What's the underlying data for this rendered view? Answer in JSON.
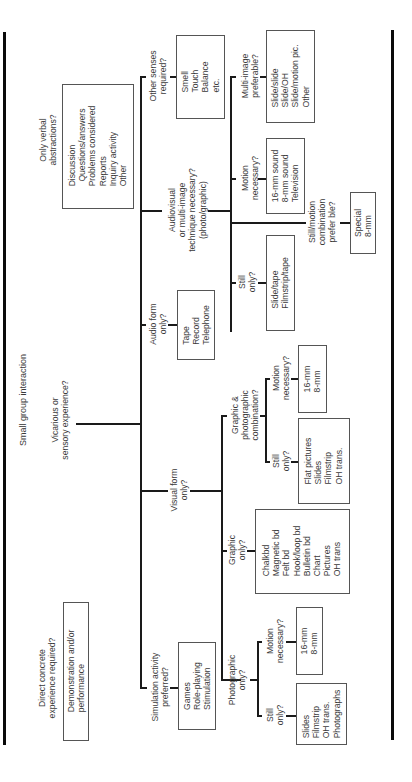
{
  "title": "Small group interaction",
  "root": {
    "vicarious": "Vicarious or|sensory experience?",
    "direct": "Direct concrete|experience required?",
    "direct_box": [
      "Demonstration and/or",
      "performance"
    ]
  },
  "verbal": {
    "question": "Only verbal|abstractions?",
    "box": [
      "Discussion",
      "  Questions/answers",
      "Problems considered",
      "Reports",
      "Inquiry activity",
      "Other"
    ]
  },
  "senses": {
    "question": "Other senses|required?",
    "box": [
      "Smell",
      "Touch",
      "Balance",
      "etc."
    ]
  },
  "audiovisual": {
    "question": "Audiovisual|or multi-image|technique necessary?|(photo/graphic)",
    "multi": {
      "question": "Multi-image|preferable?",
      "box": [
        "Slide/slide",
        "Slide/OH",
        "Slide/motion pic.",
        "Other"
      ]
    },
    "motion": {
      "question": "Motion|necessary?",
      "box": [
        "16-mm sound",
        "8-mm sound",
        "Television"
      ]
    },
    "combo": {
      "question": "Still/motion|combination|prefer ble?",
      "box": [
        "Special",
        "8-mm"
      ]
    },
    "still": {
      "question": "Still|only?",
      "box": [
        "Slide/tape",
        "Filmstrip/tape"
      ]
    }
  },
  "audio": {
    "question": "Audio form|only?",
    "box": [
      "Tape",
      "Record",
      "Telephone"
    ]
  },
  "visual": {
    "question": "Visual form|only?",
    "combination": {
      "question": "Graphic &|photographic|combination?",
      "motion": {
        "question": "Motion|necessary?",
        "box": [
          "16-mm",
          "8-mm"
        ]
      },
      "still": {
        "question": "Still|only?",
        "box": [
          "Flat pictures",
          "Slides",
          "Filmstrip",
          "OH trans."
        ]
      }
    },
    "graphic": {
      "question": "Graphic|only?",
      "box": [
        "Chalkbd",
        "Magnetic bd",
        "Felt bd",
        "Hook/loop bd",
        "Bulletin bd",
        "Chart",
        "Pictures",
        "OH trans"
      ]
    },
    "photographic": {
      "question": "Photographic|only?",
      "motion": {
        "question": "Motion|necessary?",
        "box": [
          "16-mm",
          "8-mm"
        ]
      },
      "still": {
        "question": "Still|only?",
        "box": [
          "Slides",
          "Filmstrip",
          "OH trans.",
          "Photographs"
        ]
      }
    }
  },
  "simulation": {
    "question": "Simulation activity|preferred?",
    "box": [
      "Games",
      "Role-playing",
      "Stimulation"
    ]
  }
}
